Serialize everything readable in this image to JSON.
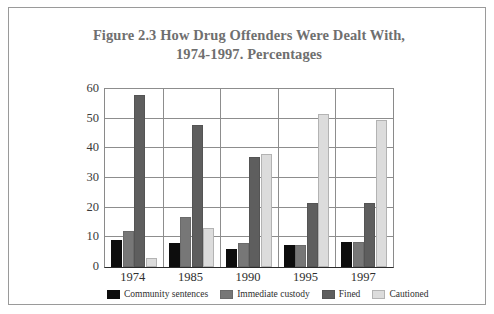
{
  "figure": {
    "title_line1": "Figure 2.3 How Drug Offenders Were Dealt With,",
    "title_line2": "1974-1997. Percentages",
    "frame_color": "#9a9a9a",
    "title_color": "#6f6f6f"
  },
  "chart_data": {
    "type": "bar",
    "title": "Figure 2.3 How Drug Offenders Were Dealt With, 1974-1997. Percentages",
    "xlabel": "",
    "ylabel": "",
    "ylim": [
      0,
      60
    ],
    "yticks": [
      0,
      10,
      20,
      30,
      40,
      50,
      60
    ],
    "grid": true,
    "legend_position": "bottom",
    "categories": [
      "1974",
      "1985",
      "1990",
      "1995",
      "1997"
    ],
    "series": [
      {
        "name": "Community sentences",
        "color": "#0d0d0d",
        "values": [
          9,
          8,
          6,
          7.5,
          8.5
        ]
      },
      {
        "name": "Immediate custody",
        "color": "#777777",
        "values": [
          12,
          17,
          8,
          7.5,
          8.5
        ]
      },
      {
        "name": "Fined",
        "color": "#5e5e5e",
        "values": [
          58,
          48,
          37,
          21.5,
          21.5
        ]
      },
      {
        "name": "Cautioned",
        "color": "#dcdcdc",
        "values": [
          3,
          13,
          38,
          51.5,
          49.5
        ]
      }
    ]
  }
}
